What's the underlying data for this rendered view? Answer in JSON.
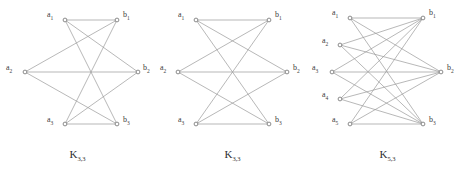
{
  "figure": {
    "background_color": "#ffffff",
    "edge_color": "#9a9a9a",
    "vertex_stroke_color": "#6e6e6e",
    "vertex_fill_color": "#ffffff",
    "label_color": "#3c3c3c"
  },
  "panels": [
    {
      "id": "panel-1",
      "caption_base": "K",
      "caption_sub": "3,3",
      "layout": "hexagon",
      "left_vertices": [
        {
          "label_base": "a",
          "label_sub": "1",
          "cx": 65,
          "cy": 20,
          "label_x": 47,
          "label_y": 11
        },
        {
          "label_base": "a",
          "label_sub": "2",
          "cx": 25,
          "cy": 72,
          "label_x": 6,
          "label_y": 64
        },
        {
          "label_base": "a",
          "label_sub": "3",
          "cx": 65,
          "cy": 124,
          "label_x": 47,
          "label_y": 116
        }
      ],
      "right_vertices": [
        {
          "label_base": "b",
          "label_sub": "1",
          "cx": 117,
          "cy": 20,
          "label_x": 123,
          "label_y": 11
        },
        {
          "label_base": "b",
          "label_sub": "2",
          "cx": 138,
          "cy": 72,
          "label_x": 143,
          "label_y": 64
        },
        {
          "label_base": "b",
          "label_sub": "3",
          "cx": 117,
          "cy": 124,
          "label_x": 123,
          "label_y": 116
        }
      ],
      "edges": [
        {
          "from": 0,
          "to": 0
        },
        {
          "from": 0,
          "to": 1
        },
        {
          "from": 0,
          "to": 2
        },
        {
          "from": 1,
          "to": 0
        },
        {
          "from": 1,
          "to": 1
        },
        {
          "from": 1,
          "to": 2
        },
        {
          "from": 2,
          "to": 0
        },
        {
          "from": 2,
          "to": 1
        },
        {
          "from": 2,
          "to": 2
        }
      ]
    },
    {
      "id": "panel-2",
      "caption_base": "K",
      "caption_sub": "3,3",
      "layout": "crossing",
      "left_vertices": [
        {
          "label_base": "a",
          "label_sub": "1",
          "cx": 41,
          "cy": 20,
          "label_x": 23,
          "label_y": 11
        },
        {
          "label_base": "a",
          "label_sub": "2",
          "cx": 23,
          "cy": 72,
          "label_x": 5,
          "label_y": 64
        },
        {
          "label_base": "a",
          "label_sub": "3",
          "cx": 41,
          "cy": 124,
          "label_x": 23,
          "label_y": 116
        }
      ],
      "right_vertices": [
        {
          "label_base": "b",
          "label_sub": "1",
          "cx": 114,
          "cy": 20,
          "label_x": 120,
          "label_y": 11
        },
        {
          "label_base": "b",
          "label_sub": "2",
          "cx": 132,
          "cy": 72,
          "label_x": 138,
          "label_y": 64
        },
        {
          "label_base": "b",
          "label_sub": "3",
          "cx": 114,
          "cy": 124,
          "label_x": 120,
          "label_y": 116
        }
      ],
      "edges": [
        {
          "from": 0,
          "to": 0
        },
        {
          "from": 0,
          "to": 1
        },
        {
          "from": 0,
          "to": 2
        },
        {
          "from": 1,
          "to": 0
        },
        {
          "from": 1,
          "to": 1
        },
        {
          "from": 1,
          "to": 2
        },
        {
          "from": 2,
          "to": 0
        },
        {
          "from": 2,
          "to": 1
        },
        {
          "from": 2,
          "to": 2
        }
      ]
    },
    {
      "id": "panel-3",
      "caption_base": "K",
      "caption_sub": "5,3",
      "layout": "crossing",
      "left_vertices": [
        {
          "label_base": "a",
          "label_sub": "1",
          "cx": 40,
          "cy": 18,
          "label_x": 22,
          "label_y": 9
        },
        {
          "label_base": "a",
          "label_sub": "2",
          "cx": 30,
          "cy": 45,
          "label_x": 12,
          "label_y": 37
        },
        {
          "label_base": "a",
          "label_sub": "3",
          "cx": 22,
          "cy": 72,
          "label_x": 2,
          "label_y": 64
        },
        {
          "label_base": "a",
          "label_sub": "4",
          "cx": 30,
          "cy": 99,
          "label_x": 12,
          "label_y": 91
        },
        {
          "label_base": "a",
          "label_sub": "5",
          "cx": 40,
          "cy": 124,
          "label_x": 22,
          "label_y": 116
        }
      ],
      "right_vertices": [
        {
          "label_base": "b",
          "label_sub": "1",
          "cx": 113,
          "cy": 18,
          "label_x": 119,
          "label_y": 9
        },
        {
          "label_base": "b",
          "label_sub": "2",
          "cx": 131,
          "cy": 72,
          "label_x": 137,
          "label_y": 64
        },
        {
          "label_base": "b",
          "label_sub": "3",
          "cx": 113,
          "cy": 124,
          "label_x": 119,
          "label_y": 116
        }
      ],
      "edges": [
        {
          "from": 0,
          "to": 0
        },
        {
          "from": 0,
          "to": 1
        },
        {
          "from": 0,
          "to": 2
        },
        {
          "from": 1,
          "to": 0
        },
        {
          "from": 1,
          "to": 1
        },
        {
          "from": 1,
          "to": 2
        },
        {
          "from": 2,
          "to": 0
        },
        {
          "from": 2,
          "to": 1
        },
        {
          "from": 2,
          "to": 2
        },
        {
          "from": 3,
          "to": 0
        },
        {
          "from": 3,
          "to": 1
        },
        {
          "from": 3,
          "to": 2
        },
        {
          "from": 4,
          "to": 0
        },
        {
          "from": 4,
          "to": 1
        },
        {
          "from": 4,
          "to": 2
        }
      ]
    }
  ]
}
